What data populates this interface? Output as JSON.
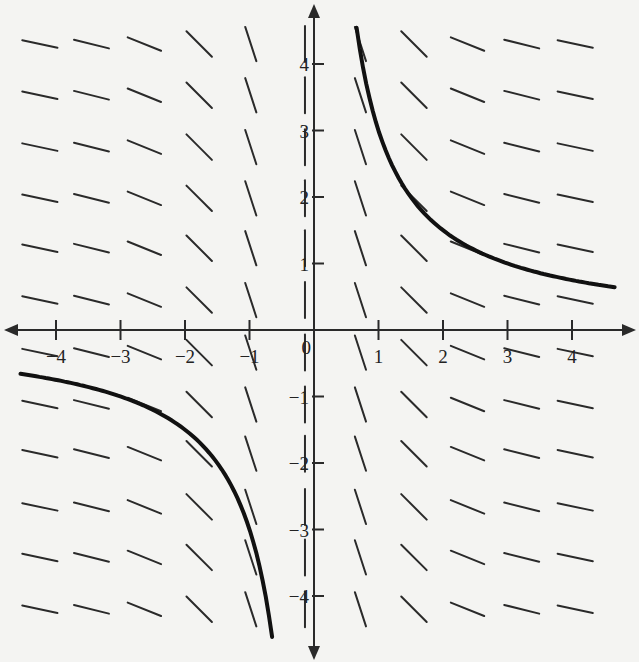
{
  "chart_data": {
    "type": "line",
    "title": "",
    "subtitle": "Slope field with solution curve y = 3/x",
    "xlabel": "",
    "ylabel": "",
    "xlim": [
      -4.7,
      4.7
    ],
    "ylim": [
      -4.8,
      4.8
    ],
    "grid": false,
    "legend": null,
    "x_ticks": [
      -4,
      -3,
      -2,
      -1,
      1,
      2,
      3,
      4
    ],
    "x_tick_labels": [
      "−4",
      "−3",
      "−2",
      "−1",
      "1",
      "2",
      "3",
      "4"
    ],
    "y_ticks": [
      4,
      3,
      2,
      1,
      -1,
      -2,
      -3,
      -4
    ],
    "y_tick_labels": [
      "4",
      "3",
      "2",
      "1",
      "−1",
      "−2",
      "−3",
      "−4"
    ],
    "origin_label": "0",
    "slope_field": {
      "x_positions": [
        -4.25,
        -3.45,
        -2.63,
        -1.78,
        -0.98,
        -0.14,
        0.72,
        1.55,
        2.38,
        3.22,
        4.05
      ],
      "y_positions": [
        4.3,
        3.53,
        2.75,
        1.98,
        1.23,
        0.45,
        -0.34,
        -1.12,
        -1.86,
        -2.66,
        -3.42,
        -4.2
      ],
      "segment_angle_deg_by_column": [
        12,
        14,
        22,
        45,
        72,
        90,
        72,
        45,
        22,
        14,
        12
      ]
    },
    "series": [
      {
        "name": "y = 3/x (x > 0)",
        "x": [
          0.66,
          0.8,
          1.0,
          1.25,
          1.5,
          2.0,
          2.5,
          3.0,
          3.5,
          4.0,
          4.66
        ],
        "y": [
          4.55,
          3.75,
          3.0,
          2.4,
          2.0,
          1.5,
          1.2,
          1.0,
          0.86,
          0.75,
          0.64
        ]
      },
      {
        "name": "y = 3/x (x < 0)",
        "x": [
          -4.55,
          -4.0,
          -3.5,
          -3.0,
          -2.5,
          -2.0,
          -1.5,
          -1.25,
          -1.0,
          -0.8,
          -0.65
        ],
        "y": [
          -0.66,
          -0.75,
          -0.86,
          -1.0,
          -1.2,
          -1.5,
          -2.0,
          -2.4,
          -3.0,
          -3.75,
          -4.6
        ]
      }
    ]
  }
}
